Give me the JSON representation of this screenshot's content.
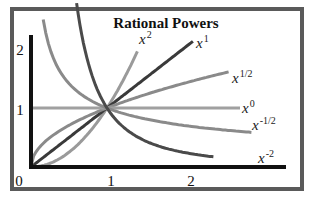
{
  "chart_data": {
    "type": "line",
    "title": "Rational Powers",
    "xlabel": "",
    "ylabel": "",
    "xlim": [
      0,
      3.1
    ],
    "ylim": [
      0,
      2.2
    ],
    "x_ticks": [
      "0",
      "1",
      "2"
    ],
    "y_ticks": [
      "1",
      "2"
    ],
    "grid": false,
    "legend": "inline labels at line ends",
    "series": [
      {
        "name": "x^2",
        "label_base": "x",
        "label_exp": "2",
        "exponent": 2,
        "color": "#9a9a9a",
        "x_range": [
          0,
          1.4
        ]
      },
      {
        "name": "x^1",
        "label_base": "x",
        "label_exp": "1",
        "exponent": 1,
        "color": "#3a3a3a",
        "x_range": [
          0,
          2.13
        ]
      },
      {
        "name": "x^1/2",
        "label_base": "x",
        "label_exp": "1/2",
        "exponent": 0.5,
        "color": "#8a8a8a",
        "x_range": [
          0,
          2.6
        ]
      },
      {
        "name": "x^0",
        "label_base": "x",
        "label_exp": "0",
        "exponent": 0,
        "color": "#a0a0a0",
        "x_range": [
          0,
          2.75
        ]
      },
      {
        "name": "x^-1/2",
        "label_base": "x",
        "label_exp": "-1/2",
        "exponent": -0.5,
        "color": "#8a8a8a",
        "x_range": [
          0.16,
          2.9
        ]
      },
      {
        "name": "x^-2",
        "label_base": "x",
        "label_exp": "-2",
        "exponent": -2,
        "color": "#4a4a4a",
        "x_range": [
          0.6,
          2.4
        ]
      }
    ]
  }
}
